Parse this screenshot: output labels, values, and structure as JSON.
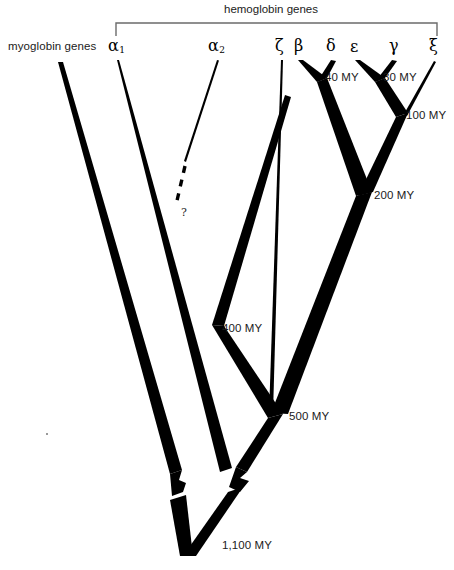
{
  "figure": {
    "type": "phylogenetic-tree",
    "title_bracket": "hemoglobin genes",
    "outgroup_label": "myoglobin genes"
  },
  "tips": [
    {
      "id": "alpha1",
      "label": "α",
      "sub": "1",
      "x": 115
    },
    {
      "id": "alpha2",
      "label": "α",
      "sub": "2",
      "x": 215
    },
    {
      "id": "zeta",
      "label": "ζ",
      "sub": "",
      "x": 280
    },
    {
      "id": "beta",
      "label": "β",
      "sub": "",
      "x": 300
    },
    {
      "id": "delta",
      "label": "δ",
      "sub": "",
      "x": 331
    },
    {
      "id": "epsilon",
      "label": "ε",
      "sub": "",
      "x": 355
    },
    {
      "id": "gamma",
      "label": "γ",
      "sub": "",
      "x": 395
    },
    {
      "id": "xi",
      "label": "ξ",
      "sub": "",
      "x": 434
    }
  ],
  "nodes": [
    {
      "id": "n40",
      "label": "40 MY",
      "x": 325,
      "y": 78
    },
    {
      "id": "n30",
      "label": "30 MY",
      "x": 383,
      "y": 78
    },
    {
      "id": "n100",
      "label": "100 MY",
      "x": 404,
      "y": 117
    },
    {
      "id": "n200",
      "label": "200 MY",
      "x": 364,
      "y": 196
    },
    {
      "id": "n400",
      "label": "400 MY",
      "x": 218,
      "y": 329
    },
    {
      "id": "n500",
      "label": "500 MY",
      "x": 275,
      "y": 417
    },
    {
      "id": "n1100",
      "label": "1,100 MY",
      "x": 222,
      "y": 546
    }
  ],
  "annotations": [
    {
      "id": "uncertain",
      "label": "?",
      "x": 183,
      "y": 215,
      "meaning": "uncertain divergence time between alpha1 and alpha2"
    }
  ],
  "colors": {
    "branch": "#000000",
    "bracket": "#555555",
    "text": "#1b1b1b",
    "background": "#ffffff"
  },
  "scale_break": {
    "present": true,
    "note": "zigzag break on both descending branches above the 1,100 MY root"
  }
}
